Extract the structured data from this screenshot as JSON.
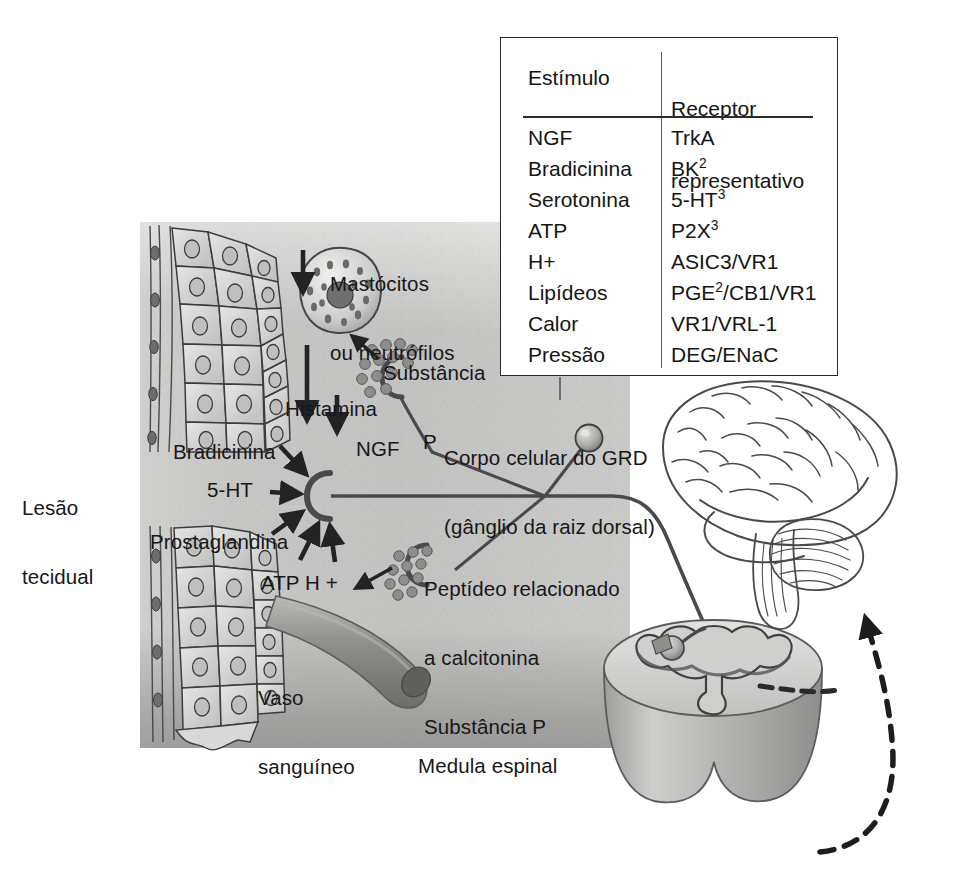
{
  "figure": {
    "language": "pt-BR"
  },
  "legend": {
    "header": {
      "stimulus": "Estímulo",
      "receptor_line1": "Receptor",
      "receptor_line2": "representativo"
    },
    "rows": [
      {
        "stimulus": "NGF",
        "receptor": "TrkA"
      },
      {
        "stimulus": "Bradicinina",
        "receptor": "BK",
        "receptor_sup": "2"
      },
      {
        "stimulus": "Serotonina",
        "receptor": "5-HT",
        "receptor_sup": "3"
      },
      {
        "stimulus": "ATP",
        "receptor": "P2X",
        "receptor_sup": "3"
      },
      {
        "stimulus": "H+",
        "receptor": "ASIC3/VR1"
      },
      {
        "stimulus": "Lipídeos",
        "receptor": "PGE",
        "receptor_sup": "2",
        "receptor_tail": "/CB1/VR1"
      },
      {
        "stimulus": "Calor",
        "receptor": "VR1/VRL-1"
      },
      {
        "stimulus": "Pressão",
        "receptor": "DEG/ENaC"
      }
    ]
  },
  "labels": {
    "tissue_injury_l1": "Lesão",
    "tissue_injury_l2": "tecidual",
    "mast_cells_l1": "Mastócitos",
    "mast_cells_l2": "ou neutrófilos",
    "substance_p_l1": "Substância",
    "substance_p_l2": "P",
    "histamine": "Histamina",
    "bradykinin": "Bradicinina",
    "serotonin": "5-HT",
    "prostaglandin": "Prostaglandina",
    "ngf": "NGF",
    "drg_l1": "Corpo celular do GRD",
    "drg_l2": "(gânglio da raiz dorsal)",
    "cgrp_l1": "Peptídeo relacionado",
    "cgrp_l2": "a calcitonina",
    "cgrp_l3": "Substância P",
    "atp_h": "ATP H +",
    "vessel_l1": "Vaso",
    "vessel_l2": "sanguíneo",
    "spinal_cord": "Medula espinal"
  },
  "colors": {
    "ink": "#17171a",
    "tissue_fill": "#c5c5c3",
    "tissue_shadow": "#8e8e8c",
    "vessel": "#8d8d8b",
    "border": "#2a2a2a",
    "brain_line": "#4a4a4a"
  }
}
